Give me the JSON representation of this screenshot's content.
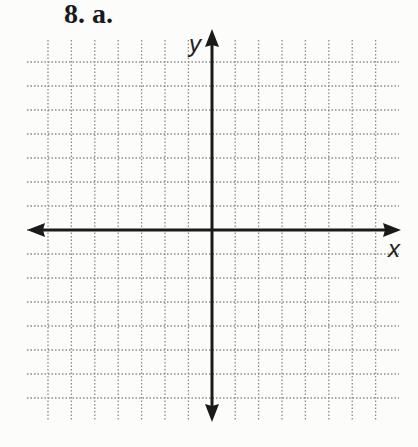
{
  "problem": {
    "label": "8. a."
  },
  "chart_data": {
    "type": "coordinate-grid",
    "title": "8. a.",
    "xlabel": "x",
    "ylabel": "y",
    "grid": {
      "columns": 14,
      "rows": 14,
      "style": "dotted",
      "on": true
    },
    "xlim": [
      -7,
      7
    ],
    "ylim": [
      -7,
      7
    ],
    "tick_labels": [],
    "series": []
  },
  "colors": {
    "axis": "#1a1a1a",
    "grid": "#8a8a8a",
    "background": "#fcfcfb"
  }
}
